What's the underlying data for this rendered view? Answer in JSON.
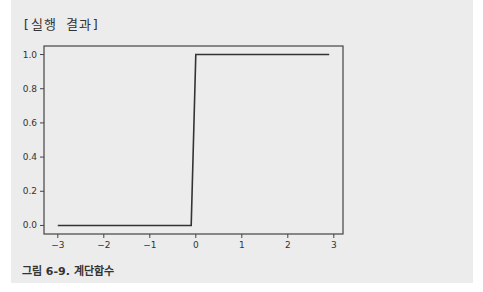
{
  "header": {
    "label": "[실행 결과]"
  },
  "caption": {
    "text": "그림 6-9. 계단함수"
  },
  "chart_data": {
    "type": "line",
    "title": "",
    "xlabel": "",
    "ylabel": "",
    "xlim": [
      -3.3,
      3.2
    ],
    "ylim": [
      -0.05,
      1.05
    ],
    "xticks": [
      -3,
      -2,
      -1,
      0,
      1,
      2,
      3
    ],
    "xtick_labels": [
      "−3",
      "−2",
      "−1",
      "0",
      "1",
      "2",
      "3"
    ],
    "yticks": [
      0.0,
      0.2,
      0.4,
      0.6,
      0.8,
      1.0
    ],
    "ytick_labels": [
      "0.0",
      "0.2",
      "0.4",
      "0.6",
      "0.8",
      "1.0"
    ],
    "grid": false,
    "series": [
      {
        "name": "step function",
        "color": "#333333",
        "x": [
          -3.0,
          -0.1,
          0.0,
          2.9
        ],
        "y": [
          0,
          0,
          1,
          1
        ]
      }
    ]
  }
}
